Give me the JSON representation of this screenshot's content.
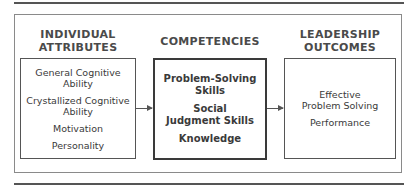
{
  "columns": [
    {
      "title_lines": [
        "INDIVIDUAL",
        "ATTRIBUTES"
      ],
      "items": [
        "General Cognitive Ability",
        "Crystallized Cognitive Ability",
        "Motivation",
        "Personality"
      ]
    },
    {
      "title_lines": [
        "COMPETENCIES"
      ],
      "items": [
        "Problem-Solving Skills",
        "Social Judgment Skills",
        "Knowledge"
      ]
    },
    {
      "title_lines": [
        "LEADERSHIP",
        "OUTCOMES"
      ],
      "items": [
        "Effective Problem Solving",
        "Performance"
      ]
    }
  ],
  "colors": {
    "line": "#555555",
    "text": "#3a3a3a",
    "frame": "#8a8a8a"
  }
}
